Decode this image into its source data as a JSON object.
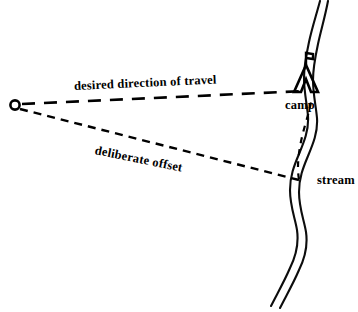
{
  "diagram": {
    "background_color": "#ffffff",
    "ink_color": "#000000",
    "width": 358,
    "height": 312,
    "labels": {
      "travel": "desired direction of travel",
      "offset": "deliberate offset",
      "camp": "camp",
      "stream": "stream"
    },
    "features": {
      "start_marker": "start-point-circle",
      "tent": "camp-tent-icon",
      "flag": "tent-flag-icon",
      "stream": "stream-watercourse",
      "travel_path": "desired-direction-dashed-line",
      "offset_path": "deliberate-offset-dashed-line",
      "branch_path": "stream-follow-dashed-line"
    },
    "geometry": {
      "start_point": [
        15,
        105
      ],
      "camp_point": [
        311,
        92
      ],
      "offset_landfall_point": [
        299,
        180
      ],
      "travel_dash": "13 9",
      "offset_dash": "8 6",
      "branch_dash": "6 6"
    }
  }
}
